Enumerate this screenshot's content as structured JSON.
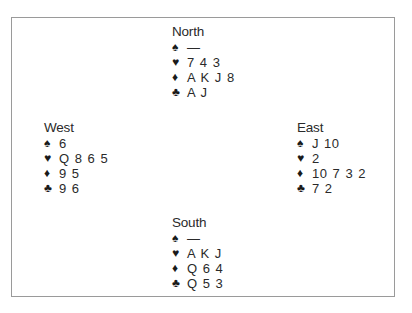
{
  "suits": [
    {
      "key": "spades",
      "glyph": "♠",
      "icon": "spade-icon"
    },
    {
      "key": "hearts",
      "glyph": "♥",
      "icon": "heart-icon"
    },
    {
      "key": "diamonds",
      "glyph": "♦",
      "icon": "diamond-icon"
    },
    {
      "key": "clubs",
      "glyph": "♣",
      "icon": "club-icon"
    }
  ],
  "hands": {
    "north": {
      "name": "North",
      "spades": "—",
      "hearts": "7 4 3",
      "diamonds": "A K J 8",
      "clubs": "A J"
    },
    "west": {
      "name": "West",
      "spades": "6",
      "hearts": "Q 8 6 5",
      "diamonds": "9 5",
      "clubs": "9 6"
    },
    "east": {
      "name": "East",
      "spades": "J 10",
      "hearts": "2",
      "diamonds": "10 7 3 2",
      "clubs": "7 2"
    },
    "south": {
      "name": "South",
      "spades": "—",
      "hearts": "A K J",
      "diamonds": "Q 6 4",
      "clubs": "Q 5 3"
    }
  },
  "colors": {
    "frame_border": "#9a9a9a",
    "text": "#2a2a2a"
  }
}
